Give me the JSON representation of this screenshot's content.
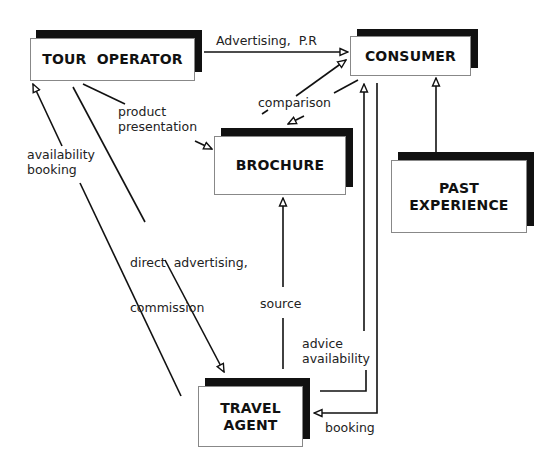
{
  "diagram": {
    "title": "",
    "nodes": [
      {
        "id": "tour_operator",
        "label": "TOUR  OPERATOR"
      },
      {
        "id": "consumer",
        "label": "CONSUMER"
      },
      {
        "id": "brochure",
        "label": "BROCHURE"
      },
      {
        "id": "past_experience",
        "label_line1": "PAST",
        "label_line2": "EXPERIENCE"
      },
      {
        "id": "travel_agent",
        "label_line1": "TRAVEL",
        "label_line2": "AGENT"
      }
    ],
    "edges": [
      {
        "from": "tour_operator",
        "to": "consumer",
        "label": "Advertising,  P.R"
      },
      {
        "from": "tour_operator",
        "to": "brochure",
        "label_line1": "product",
        "label_line2": "presentation"
      },
      {
        "from": "brochure",
        "to": "consumer",
        "label": "comparison",
        "bidirectional": true
      },
      {
        "from": "past_experience",
        "to": "consumer",
        "label": ""
      },
      {
        "from": "travel_agent",
        "to": "tour_operator",
        "label_line1": "availability",
        "label_line2": "booking"
      },
      {
        "from": "tour_operator",
        "to": "travel_agent",
        "label_line1": "direct  advertising,",
        "label_line2": "commission"
      },
      {
        "from": "travel_agent",
        "to": "brochure",
        "label": "source"
      },
      {
        "from": "travel_agent",
        "to": "consumer",
        "label_line1": "advice",
        "label_line2": "availability"
      },
      {
        "from": "consumer",
        "to": "travel_agent",
        "label": "booking"
      }
    ]
  },
  "colors": {
    "line": "#111111",
    "shadow": "#111111",
    "box_fill": "#ffffff",
    "box_border": "#888888"
  }
}
